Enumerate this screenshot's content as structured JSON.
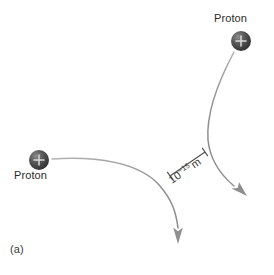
{
  "figure": {
    "panel_label": "(a)",
    "background_color": "#ffffff",
    "particle_color": "#4a4a4a",
    "trajectory_color": "#8c8c8c",
    "text_color": "#2b2b2b",
    "labels": {
      "proton_left": "Proton",
      "proton_right": "Proton"
    },
    "scale": {
      "mantissa": "10",
      "exponent": "−15",
      "unit": "m",
      "full_text": "10−15 m"
    },
    "particles": [
      {
        "name": "proton-left",
        "charge_glyph": "+",
        "label": "Proton",
        "cx": 39,
        "cy": 160,
        "r": 10
      },
      {
        "name": "proton-right",
        "charge_glyph": "+",
        "label": "Proton",
        "cx": 241,
        "cy": 41,
        "r": 10
      }
    ],
    "trajectories": [
      {
        "name": "trajectory-left-proton",
        "description": "curves right then deflects downward",
        "arrow_direction": "down"
      },
      {
        "name": "trajectory-right-proton",
        "description": "curves down then deflects toward lower right",
        "arrow_direction": "down-right"
      }
    ]
  }
}
